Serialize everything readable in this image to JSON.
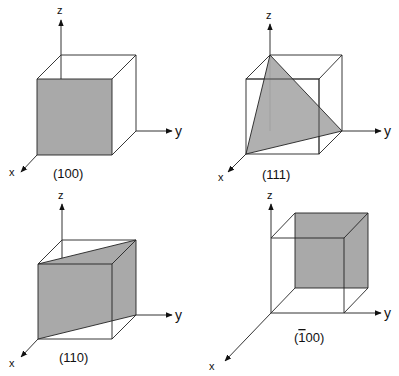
{
  "figure": {
    "shade_color": "#a9a9a9",
    "line_color": "#222222",
    "panels": [
      {
        "id": "p100",
        "plane_label": "(100)",
        "axes": {
          "x": "x",
          "y": "y",
          "z": "z"
        },
        "front": [
          37,
          79,
          112,
          155
        ],
        "back": [
          61,
          55,
          136,
          131
        ],
        "shaded_polygon": [
          [
            37,
            79
          ],
          [
            112,
            79
          ],
          [
            112,
            155
          ],
          [
            37,
            155
          ]
        ]
      },
      {
        "id": "p111",
        "plane_label": "(111)",
        "axes": {
          "x": "x",
          "y": "y",
          "z": "z"
        },
        "shaded_polygon": [
          [
            270,
            55
          ],
          [
            342,
            131
          ],
          [
            246,
            154
          ]
        ]
      },
      {
        "id": "p110",
        "plane_label": "(110)",
        "axes": {
          "x": "x",
          "y": "y",
          "z": "z"
        },
        "shaded_polygon": [
          [
            38,
            264
          ],
          [
            136,
            240
          ],
          [
            136,
            315
          ],
          [
            38,
            339
          ]
        ]
      },
      {
        "id": "pbar100",
        "plane_label_bar": "1",
        "plane_label_rest": "00)",
        "plane_label_open": "(",
        "plane_label": "(1̄00)",
        "axes": {
          "x": "x",
          "y": "y",
          "z": "z"
        },
        "shaded_polygon": [
          [
            295,
            213
          ],
          [
            368,
            213
          ],
          [
            368,
            288
          ],
          [
            295,
            288
          ]
        ]
      }
    ]
  }
}
